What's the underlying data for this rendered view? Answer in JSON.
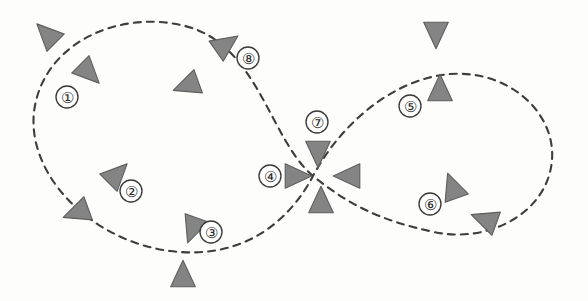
{
  "figure": {
    "width": 588,
    "height": 301,
    "background_color": "#fdfdfc"
  },
  "trajectory": {
    "name": "figure-eight-dashed-path",
    "style": "dashed",
    "stroke_color": "#3d3d3d",
    "stroke_width": 2.1,
    "dash_pattern": "7 6",
    "crossing_point": {
      "x": 313,
      "y": 176
    },
    "path_d": "M 313 176 C 270 140 258 44 185 26 C 118 9 42 44 34 112 C 27 176 92 241 170 251 C 248 261 292 216 313 176 C 334 136 378 88 436 76 C 500 63 556 108 552 160 C 548 212 490 244 434 232 C 378 220 348 204 313 176 Z"
  },
  "waypoints": [
    {
      "id": "waypoint-1",
      "label": "①",
      "x": 67,
      "y": 97,
      "r": 11
    },
    {
      "id": "waypoint-2",
      "label": "②",
      "x": 131,
      "y": 191,
      "r": 11
    },
    {
      "id": "waypoint-3",
      "label": "③",
      "x": 211,
      "y": 232,
      "r": 11
    },
    {
      "id": "waypoint-4",
      "label": "④",
      "x": 270,
      "y": 176,
      "r": 11
    },
    {
      "id": "waypoint-5",
      "label": "⑤",
      "x": 410,
      "y": 106,
      "r": 11
    },
    {
      "id": "waypoint-6",
      "label": "⑥",
      "x": 430,
      "y": 204,
      "r": 11
    },
    {
      "id": "waypoint-7",
      "label": "⑦",
      "x": 317,
      "y": 122,
      "r": 11
    },
    {
      "id": "waypoint-8",
      "label": "⑧",
      "x": 248,
      "y": 58,
      "r": 11
    }
  ],
  "agents": [
    {
      "id": "agent-top-left-outer",
      "x": 48,
      "y": 35,
      "heading_deg": 315,
      "size": 15
    },
    {
      "id": "agent-waypoint-1-inner",
      "x": 88,
      "y": 72,
      "heading_deg": 135,
      "size": 15
    },
    {
      "id": "agent-upper-mid-left",
      "x": 188,
      "y": 85,
      "heading_deg": 250,
      "size": 15
    },
    {
      "id": "agent-waypoint-8",
      "x": 225,
      "y": 45,
      "heading_deg": 55,
      "size": 15
    },
    {
      "id": "agent-waypoint-2",
      "x": 116,
      "y": 175,
      "heading_deg": 45,
      "size": 15
    },
    {
      "id": "agent-left-outer-mid",
      "x": 78,
      "y": 212,
      "heading_deg": 250,
      "size": 15
    },
    {
      "id": "agent-waypoint-3",
      "x": 193,
      "y": 228,
      "heading_deg": 200,
      "size": 15
    },
    {
      "id": "agent-bottom-outer",
      "x": 183,
      "y": 276,
      "heading_deg": 0,
      "size": 15
    },
    {
      "id": "agent-cross-west",
      "x": 296,
      "y": 176,
      "heading_deg": 90,
      "size": 15
    },
    {
      "id": "agent-cross-east",
      "x": 349,
      "y": 176,
      "heading_deg": 270,
      "size": 15
    },
    {
      "id": "agent-cross-north",
      "x": 318,
      "y": 152,
      "heading_deg": 180,
      "size": 15
    },
    {
      "id": "agent-cross-south",
      "x": 321,
      "y": 202,
      "heading_deg": 0,
      "size": 15
    },
    {
      "id": "agent-top-right-outer",
      "x": 436,
      "y": 33,
      "heading_deg": 180,
      "size": 15
    },
    {
      "id": "agent-waypoint-5",
      "x": 440,
      "y": 90,
      "heading_deg": 0,
      "size": 15
    },
    {
      "id": "agent-waypoint-6-upper",
      "x": 453,
      "y": 188,
      "heading_deg": 340,
      "size": 15
    },
    {
      "id": "agent-waypoint-6-lower",
      "x": 486,
      "y": 220,
      "heading_deg": 290,
      "size": 15
    }
  ],
  "colors": {
    "agent_fill": "#848484",
    "agent_stroke": "#5d5d5d",
    "path_stroke": "#3d3d3d",
    "label_text": "#2a2a2a",
    "circle_fill": "#ffffff"
  }
}
